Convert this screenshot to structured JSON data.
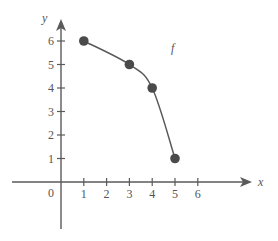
{
  "chart_data": {
    "type": "scatter",
    "title": "",
    "xlabel": "x",
    "ylabel": "y",
    "xlim": [
      -2,
      8.5
    ],
    "ylim": [
      -2,
      7
    ],
    "x_ticks": [
      1,
      2,
      3,
      4,
      5,
      6
    ],
    "x_tick_labels": [
      "1",
      "2",
      "3",
      "4",
      "5",
      "6"
    ],
    "y_ticks": [
      1,
      2,
      3,
      4,
      5,
      6
    ],
    "y_tick_labels": [
      "1",
      "2",
      "3",
      "4",
      "5",
      "6"
    ],
    "origin_label": "0",
    "grid": false,
    "series": [
      {
        "name": "f",
        "label": "f",
        "curve": "smooth",
        "points": [
          {
            "x": 1,
            "y": 6
          },
          {
            "x": 3,
            "y": 5
          },
          {
            "x": 4,
            "y": 4
          },
          {
            "x": 5,
            "y": 1
          }
        ]
      }
    ],
    "colors": {
      "axis": "#5a5a5a",
      "curve": "#5a5a5a",
      "point": "#4a4a4a"
    }
  }
}
